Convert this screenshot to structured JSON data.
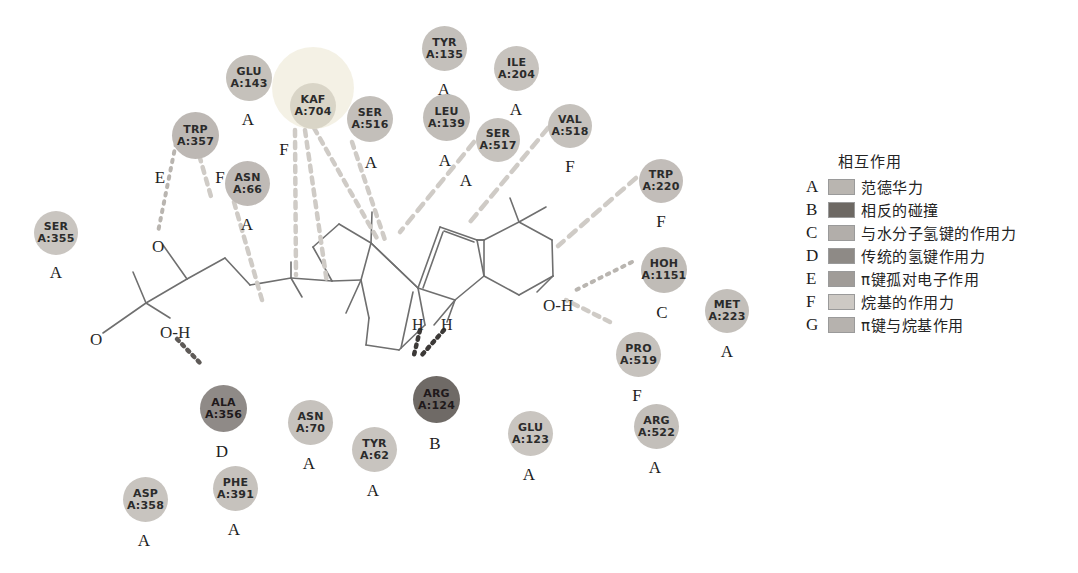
{
  "diagram": {
    "kind": "2D protein-ligand interaction diagram",
    "ligand_atom_labels": [
      {
        "text": "O",
        "x": 152,
        "y": 237,
        "size": 17
      },
      {
        "text": "O",
        "x": 90,
        "y": 330,
        "size": 17
      },
      {
        "text": "O-H",
        "x": 160,
        "y": 323,
        "size": 17
      },
      {
        "text": "H",
        "x": 412,
        "y": 316,
        "size": 16
      },
      {
        "text": "H",
        "x": 441,
        "y": 316,
        "size": 16
      },
      {
        "text": "O-H",
        "x": 543,
        "y": 296,
        "size": 17
      }
    ]
  },
  "residues": [
    {
      "name": "SER",
      "chain": "A:355",
      "code": "A",
      "x": 34,
      "y": 211,
      "d": 44,
      "fill": "#c9c5c0",
      "font": 11,
      "codeDX": 10,
      "codeDY": 8
    },
    {
      "name": "TRP",
      "chain": "A:357",
      "code": "E",
      "x": 172,
      "y": 112,
      "d": 47,
      "fill": "#bdb8b4",
      "font": 11,
      "codeDX": -24,
      "codeDY": 9,
      "code2": "F",
      "code2DX": 36,
      "code2DY": 9
    },
    {
      "name": "GLU",
      "chain": "A:143",
      "code": "A",
      "x": 226,
      "y": 55,
      "d": 46,
      "fill": "#c5c1bb",
      "font": 11,
      "codeDX": 10,
      "codeDY": 9
    },
    {
      "name": "KAF",
      "chain": "A:704",
      "code": "F",
      "x": 290,
      "y": 83,
      "d": 46,
      "fill": "#d9d5c7",
      "font": 11,
      "codeDX": -18,
      "codeDY": 11,
      "halo": {
        "x": 272,
        "y": 47,
        "d": 82
      }
    },
    {
      "name": "ASN",
      "chain": "A:66",
      "code": "A",
      "x": 225,
      "y": 161,
      "d": 45,
      "fill": "#bfbab6",
      "font": 11,
      "codeDX": 10,
      "codeDY": 9
    },
    {
      "name": "SER",
      "chain": "A:516",
      "code": "A",
      "x": 347,
      "y": 96,
      "d": 46,
      "fill": "#c3bfba",
      "font": 11,
      "codeDX": 12,
      "codeDY": 11
    },
    {
      "name": "TYR",
      "chain": "A:135",
      "code": "A",
      "x": 422,
      "y": 26,
      "d": 45,
      "fill": "#c4c0bb",
      "font": 11,
      "codeDX": 10,
      "codeDY": 9
    },
    {
      "name": "LEU",
      "chain": "A:139",
      "code": "A",
      "x": 423,
      "y": 94,
      "d": 47,
      "fill": "#c1bdb8",
      "font": 11,
      "codeDX": 10,
      "codeDY": 10
    },
    {
      "name": "ILE",
      "chain": "A:204",
      "code": "A",
      "x": 494,
      "y": 46,
      "d": 45,
      "fill": "#c7c3be",
      "font": 11,
      "codeDX": 10,
      "codeDY": 9
    },
    {
      "name": "SER",
      "chain": "A:517",
      "code": "A",
      "x": 476,
      "y": 118,
      "d": 44,
      "fill": "#c6c2bd",
      "font": 11,
      "codeDX": -22,
      "codeDY": 9
    },
    {
      "name": "VAL",
      "chain": "A:518",
      "code": "F",
      "x": 548,
      "y": 104,
      "d": 44,
      "fill": "#c5c1bc",
      "font": 11,
      "codeDX": 10,
      "codeDY": 9
    },
    {
      "name": "TRP",
      "chain": "A:220",
      "code": "F",
      "x": 639,
      "y": 159,
      "d": 44,
      "fill": "#c2bdb9",
      "font": 11,
      "codeDX": 10,
      "codeDY": 9
    },
    {
      "name": "HOH",
      "chain": "A:1151",
      "code": "C",
      "x": 641,
      "y": 247,
      "d": 46,
      "fill": "#c0bcb7",
      "font": 11,
      "codeDX": 9,
      "codeDY": 10
    },
    {
      "name": "MET",
      "chain": "A:223",
      "code": "A",
      "x": 705,
      "y": 289,
      "d": 44,
      "fill": "#c3bfba",
      "font": 11,
      "codeDX": 10,
      "codeDY": 9
    },
    {
      "name": "PRO",
      "chain": "A:519",
      "code": "F",
      "x": 616,
      "y": 332,
      "d": 45,
      "fill": "#c6c2bd",
      "font": 11,
      "codeDX": 9,
      "codeDY": 9
    },
    {
      "name": "ALA",
      "chain": "A:356",
      "code": "D",
      "x": 200,
      "y": 385,
      "d": 47,
      "fill": "#8f8a87",
      "font": 11,
      "dark": true,
      "codeDX": 10,
      "codeDY": 10
    },
    {
      "name": "ARG",
      "chain": "A:124",
      "code": "B",
      "x": 413,
      "y": 376,
      "d": 47,
      "fill": "#6f6a66",
      "font": 11,
      "dark": true,
      "codeDX": 10,
      "codeDY": 11
    },
    {
      "name": "ASN",
      "chain": "A:70",
      "code": "A",
      "x": 288,
      "y": 400,
      "d": 45,
      "fill": "#c6c2bd",
      "font": 11,
      "codeDX": 9,
      "codeDY": 9
    },
    {
      "name": "TYR",
      "chain": "A:62",
      "code": "A",
      "x": 352,
      "y": 427,
      "d": 45,
      "fill": "#c8c4bf",
      "font": 11,
      "codeDX": 9,
      "codeDY": 9
    },
    {
      "name": "GLU",
      "chain": "A:123",
      "code": "A",
      "x": 508,
      "y": 411,
      "d": 45,
      "fill": "#c9c5c0",
      "font": 11,
      "codeDX": 9,
      "codeDY": 9
    },
    {
      "name": "ARG",
      "chain": "A:522",
      "code": "A",
      "x": 634,
      "y": 404,
      "d": 45,
      "fill": "#c3bfba",
      "font": 11,
      "codeDX": 9,
      "codeDY": 9
    },
    {
      "name": "ASP",
      "chain": "A:358",
      "code": "A",
      "x": 123,
      "y": 477,
      "d": 45,
      "fill": "#c8c4bf",
      "font": 11,
      "codeDX": 9,
      "codeDY": 9
    },
    {
      "name": "PHE",
      "chain": "A:391",
      "code": "A",
      "x": 213,
      "y": 466,
      "d": 45,
      "fill": "#c6c2bd",
      "font": 11,
      "codeDX": 9,
      "codeDY": 9
    }
  ],
  "legend": {
    "title": "相互作用",
    "items": [
      {
        "key": "A",
        "label": "范德华力",
        "color": "#b9b5b0"
      },
      {
        "key": "B",
        "label": "相反的碰撞",
        "color": "#6d6863"
      },
      {
        "key": "C",
        "label": "与水分子氢键的作用力",
        "color": "#b2aeaa"
      },
      {
        "key": "D",
        "label": "传统的氢键作用力",
        "color": "#8e8a86"
      },
      {
        "key": "E",
        "label": "π键孤对电子作用",
        "color": "#a09c98"
      },
      {
        "key": "F",
        "label": "烷基的作用力",
        "color": "#cdc9c4"
      },
      {
        "key": "G",
        "label": "π键与烷基作用",
        "color": "#b6b2ae"
      }
    ]
  }
}
